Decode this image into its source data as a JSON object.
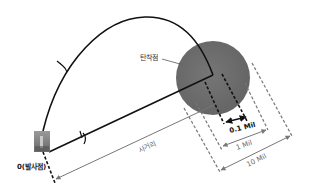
{
  "diagram": {
    "labels": {
      "impact_point": "탄착점",
      "launch_point": "0(발사점)",
      "range": "사거리",
      "mil_01": "0.1 Mil",
      "mil_1": "1 Mil",
      "mil_10": "10 Mil"
    },
    "colors": {
      "line": "#111111",
      "impact_circle": "#6e6e6e",
      "dim_line": "#777777",
      "background": "#ffffff"
    }
  }
}
